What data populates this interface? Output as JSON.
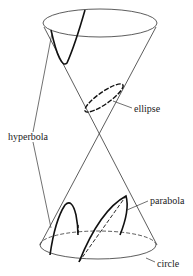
{
  "diagram": {
    "labels": {
      "ellipse": "ellipse",
      "hyperbola": "hyperbola",
      "parabola": "parabola",
      "circle": "circle"
    },
    "colors": {
      "stroke": "#333333",
      "background": "#ffffff"
    }
  }
}
